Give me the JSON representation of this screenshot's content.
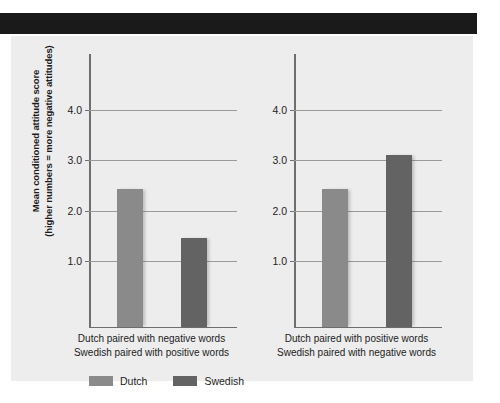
{
  "figure": {
    "background_color": "#ededed",
    "header_rule_color": "#1a1a1a"
  },
  "chart_data": {
    "type": "bar",
    "title": "",
    "xlabel": "",
    "ylabel": "Mean conditioned attitude score (higher numbers = more negative attitudes)",
    "ylabel_line1": "Mean conditioned attitude score",
    "ylabel_line2": "(higher numbers = more negative attitudes)",
    "ylim": [
      0,
      4.4
    ],
    "yticks": [
      1.0,
      2.0,
      3.0,
      4.0
    ],
    "ytick_labels": [
      "1.0",
      "2.0",
      "3.0",
      "4.0"
    ],
    "grid": true,
    "legend_position": "bottom",
    "panels": [
      {
        "id": "panel-left",
        "caption_line1": "Dutch paired with negative words",
        "caption_line2": "Swedish paired with positive words",
        "categories": [
          "Dutch",
          "Swedish"
        ],
        "values": [
          2.72,
          1.76
        ]
      },
      {
        "id": "panel-right",
        "caption_line1": "Dutch paired with positive words",
        "caption_line2": "Swedish paired with negative words",
        "categories": [
          "Dutch",
          "Swedish"
        ],
        "values": [
          2.72,
          3.4
        ]
      }
    ],
    "series": [
      {
        "name": "Dutch",
        "color": "#8a8a8a",
        "values": [
          2.72,
          2.72
        ]
      },
      {
        "name": "Swedish",
        "color": "#636363",
        "values": [
          1.76,
          3.4
        ]
      }
    ],
    "legend": [
      {
        "label": "Dutch",
        "color": "#8a8a8a"
      },
      {
        "label": "Swedish",
        "color": "#636363"
      }
    ]
  }
}
